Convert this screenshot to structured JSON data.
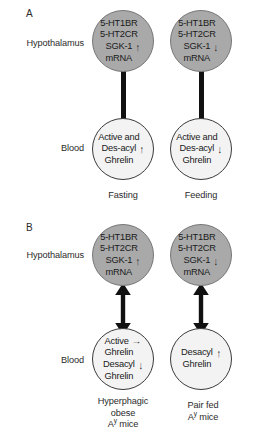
{
  "figure": {
    "panels": [
      {
        "letter": "A",
        "row_labels": {
          "top": "Hypothalamus",
          "bottom": "Blood"
        },
        "columns": [
          {
            "condition": "Fasting",
            "brain_node": {
              "lines": [
                {
                  "text": "5-HT1BR",
                  "arrow": ""
                },
                {
                  "text": "5-HT2CR",
                  "arrow": ""
                },
                {
                  "text": "SGK-1",
                  "arrow": "↑"
                },
                {
                  "text": "mRNA",
                  "arrow": ""
                }
              ]
            },
            "blood_node": {
              "lines": [
                {
                  "text": "Active and",
                  "arrow": ""
                },
                {
                  "text": "Des-acyl",
                  "arrow": "↑"
                },
                {
                  "text": "Ghrelin",
                  "arrow": ""
                }
              ]
            },
            "connector": "bar"
          },
          {
            "condition": "Feeding",
            "brain_node": {
              "lines": [
                {
                  "text": "5-HT1BR",
                  "arrow": ""
                },
                {
                  "text": "5-HT2CR",
                  "arrow": ""
                },
                {
                  "text": "SGK-1",
                  "arrow": "↓"
                },
                {
                  "text": "mRNA",
                  "arrow": ""
                }
              ]
            },
            "blood_node": {
              "lines": [
                {
                  "text": "Active and",
                  "arrow": ""
                },
                {
                  "text": "Des-acyl",
                  "arrow": "↓"
                },
                {
                  "text": "Ghrelin",
                  "arrow": ""
                }
              ]
            },
            "connector": "bar"
          }
        ]
      },
      {
        "letter": "B",
        "row_labels": {
          "top": "Hypothalamus",
          "bottom": "Blood"
        },
        "columns": [
          {
            "condition_line1": "Hyperphagic",
            "condition_line2": "obese",
            "condition_line3_prefix": "A",
            "condition_line3_sup": "y",
            "condition_line3_suffix": " mice",
            "brain_node": {
              "lines": [
                {
                  "text": "5-HT1BR",
                  "arrow": ""
                },
                {
                  "text": "5-HT2CR",
                  "arrow": ""
                },
                {
                  "text": "SGK-1",
                  "arrow": "↑"
                },
                {
                  "text": "mRNA",
                  "arrow": ""
                }
              ]
            },
            "blood_node": {
              "lines": [
                {
                  "text": "Active",
                  "arrow": "→"
                },
                {
                  "text": "Ghrelin",
                  "arrow": ""
                },
                {
                  "text": "Desacyl",
                  "arrow": "↓"
                },
                {
                  "text": "Ghrelin",
                  "arrow": ""
                }
              ]
            },
            "connector": "double-arrow"
          },
          {
            "condition_line1": "Pair fed",
            "condition_line2": "",
            "condition_line3_prefix": "A",
            "condition_line3_sup": "y",
            "condition_line3_suffix": " mice",
            "brain_node": {
              "lines": [
                {
                  "text": "5-HT1BR",
                  "arrow": ""
                },
                {
                  "text": "5-HT2CR",
                  "arrow": ""
                },
                {
                  "text": "SGK-1",
                  "arrow": "↓"
                },
                {
                  "text": "mRNA",
                  "arrow": ""
                }
              ]
            },
            "blood_node": {
              "lines": [
                {
                  "text": "Desacyl",
                  "arrow": "↑"
                },
                {
                  "text": "Ghrelin",
                  "arrow": ""
                }
              ]
            },
            "connector": "double-arrow"
          }
        ]
      }
    ],
    "colors": {
      "brain_fill": "#a9a9a9",
      "brain_stroke": "#777777",
      "blood_fill": "#f3f3f3",
      "blood_stroke": "#3a3a3a",
      "connector": "#111111",
      "text": "#2b2b2b",
      "background": "#ffffff"
    }
  }
}
